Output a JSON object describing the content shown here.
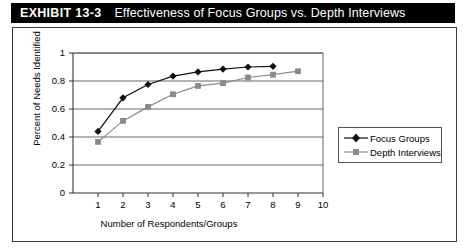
{
  "header": {
    "exhibit_number": "EXHIBIT 13-3",
    "title": "Effectiveness of Focus Groups vs. Depth Interviews",
    "bar_color": "#000000",
    "text_color": "#ffffff"
  },
  "chart_data": {
    "type": "line",
    "title": "",
    "xlabel": "Number of Respondents/Groups",
    "ylabel": "Percent of Needs Identified",
    "xlim": [
      0,
      10
    ],
    "ylim": [
      0,
      1
    ],
    "xticks": [
      "1",
      "2",
      "3",
      "4",
      "5",
      "6",
      "7",
      "8",
      "9",
      "10"
    ],
    "yticks": [
      "0",
      "0.2",
      "0.4",
      "0.6",
      "0.8",
      "1"
    ],
    "grid": "horizontal",
    "legend_position": "right",
    "series": [
      {
        "name": "Focus Groups",
        "marker": "diamond",
        "color": "#111111",
        "x": [
          1,
          2,
          3,
          4,
          5,
          6,
          7,
          8
        ],
        "values": [
          0.44,
          0.68,
          0.775,
          0.835,
          0.865,
          0.885,
          0.9,
          0.905
        ]
      },
      {
        "name": "Depth Interviews",
        "marker": "square",
        "color": "#8a8a8a",
        "x": [
          1,
          2,
          3,
          4,
          5,
          6,
          7,
          8,
          9
        ],
        "values": [
          0.365,
          0.515,
          0.615,
          0.705,
          0.765,
          0.785,
          0.825,
          0.845,
          0.87
        ]
      }
    ]
  }
}
